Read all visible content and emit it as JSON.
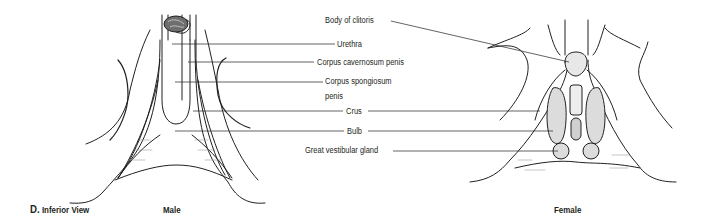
{
  "figure": {
    "panel_letter": "D.",
    "panel_title": "Inferior View",
    "subfigures": [
      {
        "name": "male",
        "caption": "Male"
      },
      {
        "name": "female",
        "caption": "Female"
      }
    ]
  },
  "labels": {
    "body_of_clitoris": "Body of clitoris",
    "urethra": "Urethra",
    "corpus_cavernosum_penis": "Corpus cavernosum penis",
    "corpus_spongiosum_line1": "Corpus spongiosum",
    "corpus_spongiosum_line2": "penis",
    "crus": "Crus",
    "bulb": "Bulb",
    "great_vestibular_gland": "Great vestibular gland"
  },
  "colors": {
    "line": "#231f20",
    "shading": "#d9d9d9",
    "background": "#ffffff"
  }
}
